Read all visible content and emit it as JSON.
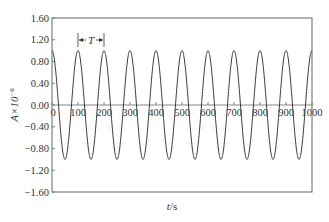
{
  "chart_data": {
    "type": "line",
    "title": "",
    "xlabel": "t/s",
    "ylabel": "A×10^-6",
    "xlim": [
      0,
      1000
    ],
    "ylim": [
      -1.6,
      1.6
    ],
    "x_ticks": [
      "0",
      "100",
      "200",
      "300",
      "400",
      "500",
      "600",
      "700",
      "800",
      "900",
      "1000"
    ],
    "y_ticks": [
      "1.60",
      "1.20",
      "0.80",
      "0.40",
      "0.00",
      "-0.40",
      "-0.80",
      "-1.20",
      "-1.60"
    ],
    "grid": false,
    "legend": null,
    "series": [
      {
        "name": "A(t)",
        "function": "cos(2*pi*t/T)",
        "amplitude": 1.0,
        "period": 100,
        "x": [
          0,
          50,
          100,
          150,
          200,
          250,
          300,
          350,
          400,
          450,
          500,
          550,
          600,
          650,
          700,
          750,
          800,
          850,
          900,
          950,
          1000
        ],
        "values": [
          1.0,
          -1.0,
          1.0,
          -1.0,
          1.0,
          -1.0,
          1.0,
          -1.0,
          1.0,
          -1.0,
          1.0,
          -1.0,
          1.0,
          -1.0,
          1.0,
          -1.0,
          1.0,
          -1.0,
          1.0,
          -1.0,
          1.0
        ]
      }
    ],
    "annotations": [
      {
        "text": "T",
        "type": "period-arrow",
        "x_start": 100,
        "x_end": 200,
        "y": 1.2
      }
    ]
  },
  "labels": {
    "xlabel_var": "t",
    "xlabel_unit": "/s",
    "ylabel_main": "A×10",
    "ylabel_exp": "−6",
    "period_label": "T"
  },
  "colors": {
    "line": "#3a3a3a",
    "axis": "#555555",
    "zero_line": "#888888"
  }
}
